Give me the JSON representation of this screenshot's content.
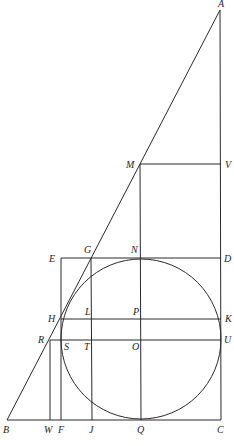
{
  "figure": {
    "stroke_color": "#2a2a2a",
    "label_color": "#1e1e1e",
    "background": "#ffffff"
  },
  "points": {
    "A": [
      220,
      10
    ],
    "B": [
      7,
      420
    ],
    "C": [
      221,
      420
    ],
    "M": [
      140,
      164
    ],
    "V": [
      221,
      164
    ],
    "E": [
      61,
      258
    ],
    "G": [
      91,
      258
    ],
    "N": [
      141,
      258
    ],
    "D": [
      221,
      258
    ],
    "H": [
      61,
      319
    ],
    "L": [
      92,
      319
    ],
    "P": [
      141,
      319
    ],
    "K": [
      221,
      319
    ],
    "R": [
      50,
      340
    ],
    "S": [
      61,
      340
    ],
    "T": [
      92,
      340
    ],
    "O": [
      141,
      340
    ],
    "U": [
      221,
      340
    ],
    "W": [
      50,
      420
    ],
    "F": [
      61,
      420
    ],
    "J": [
      92,
      420
    ],
    "Q": [
      141,
      420
    ]
  },
  "circle": {
    "center": "O",
    "cx": 141,
    "cy": 339,
    "r": 80
  },
  "labels": [
    {
      "text": "A",
      "x": 218,
      "y": 7
    },
    {
      "text": "M",
      "x": 126,
      "y": 168
    },
    {
      "text": "V",
      "x": 225,
      "y": 168
    },
    {
      "text": "E",
      "x": 49,
      "y": 262
    },
    {
      "text": "G",
      "x": 84,
      "y": 253
    },
    {
      "text": "N",
      "x": 131,
      "y": 253
    },
    {
      "text": "D",
      "x": 224,
      "y": 262
    },
    {
      "text": "H",
      "x": 48,
      "y": 322
    },
    {
      "text": "L",
      "x": 85,
      "y": 315
    },
    {
      "text": "P",
      "x": 133,
      "y": 315
    },
    {
      "text": "K",
      "x": 225,
      "y": 322
    },
    {
      "text": "R",
      "x": 38,
      "y": 343
    },
    {
      "text": "S",
      "x": 64,
      "y": 350
    },
    {
      "text": "T",
      "x": 84,
      "y": 350
    },
    {
      "text": "O",
      "x": 132,
      "y": 350
    },
    {
      "text": "U",
      "x": 224,
      "y": 343
    },
    {
      "text": "B",
      "x": 3,
      "y": 433
    },
    {
      "text": "W",
      "x": 44,
      "y": 433
    },
    {
      "text": "F",
      "x": 58,
      "y": 433
    },
    {
      "text": "J",
      "x": 89,
      "y": 433
    },
    {
      "text": "Q",
      "x": 137,
      "y": 433
    },
    {
      "text": "C",
      "x": 217,
      "y": 433
    }
  ],
  "segments": [
    {
      "name": "hypotenuse-AB",
      "from": "A",
      "to": "B"
    },
    {
      "name": "side-AC",
      "from": "A",
      "to": "C"
    },
    {
      "name": "base-BC",
      "from": "B",
      "to": "C"
    },
    {
      "name": "segment-MV",
      "from": "M",
      "to": "V"
    },
    {
      "name": "segment-MQ",
      "from": "M",
      "to": "Q"
    },
    {
      "name": "segment-ED",
      "from": "E",
      "to": "D"
    },
    {
      "name": "segment-EF",
      "from": "E",
      "to": "F"
    },
    {
      "name": "segment-GJ",
      "from": "G",
      "to": "J"
    },
    {
      "name": "segment-HK",
      "from": "H",
      "to": "K"
    },
    {
      "name": "segment-RU",
      "from": "R",
      "to": "U"
    },
    {
      "name": "segment-RW",
      "from": "R",
      "to": "W"
    }
  ]
}
